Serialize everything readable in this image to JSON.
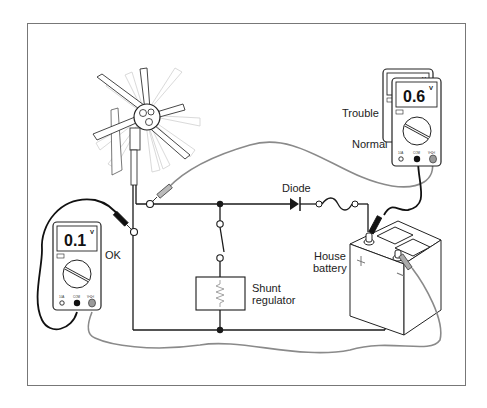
{
  "figure": {
    "labels": {
      "diode": "Diode",
      "shunt_regulator_line1": "Shunt",
      "shunt_regulator_line2": "regulator",
      "house_battery_line1": "House",
      "house_battery_line2": "battery",
      "ok": "OK",
      "trouble": "Trouble",
      "normal": "Normal"
    },
    "meters": [
      {
        "id": "left-meter",
        "reading": "0.1",
        "unit": "V",
        "status": "OK"
      },
      {
        "id": "right-meter-back",
        "reading": "1.1",
        "unit": "V",
        "status": "Trouble"
      },
      {
        "id": "right-meter-front",
        "reading": "0.6",
        "unit": "V",
        "status": "Normal"
      }
    ],
    "meter_jacks": [
      "10A",
      "COM",
      "V•Ω•I"
    ],
    "battery_terminals": {
      "positive": "+",
      "negative": "−"
    },
    "colors": {
      "wire": "#1a1a1a",
      "test_lead_grey": "#8a8a8a",
      "frame": "#777777",
      "background": "#ffffff"
    }
  }
}
